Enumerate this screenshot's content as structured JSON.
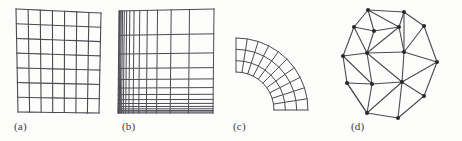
{
  "figure": {
    "width": 462,
    "height": 141,
    "background_color": "#fdfdfc",
    "line_color": "#4a4a52",
    "node_color": "#27272c",
    "caption_color": "#3a3a3e"
  },
  "captions": {
    "a": "(a)",
    "b": "(b)",
    "c": "(c)",
    "d": "(d)"
  },
  "chart_data": [
    {
      "type": "mesh-structured-uniform",
      "panel": "a",
      "title": "(a)",
      "description": "Uniform structured quadrilateral grid, slightly skewed quadrilateral outline",
      "n_columns": 7,
      "n_rows": 7,
      "n_vertical_lines": 8,
      "n_horizontal_lines": 8,
      "spacing": "uniform",
      "corners": {
        "top_left": [
          16,
          9
        ],
        "top_right": [
          101,
          13
        ],
        "bottom_right": [
          99,
          113
        ],
        "bottom_left": [
          18,
          112
        ]
      },
      "line_color": "#4a4a52",
      "line_width": 1.1
    },
    {
      "type": "mesh-structured-graded",
      "panel": "b",
      "title": "(b)",
      "description": "Graded (geometrically stretched) structured quadrilateral grid; lines clustered toward the left edge and the bottom edge",
      "n_columns": 14,
      "n_rows": 13,
      "n_vertical_lines": 15,
      "n_horizontal_lines": 14,
      "spacing": "geometric",
      "clustering_x": "left",
      "clustering_y": "bottom",
      "growth_ratio_x": 1.34,
      "growth_ratio_y": 1.3,
      "corners": {
        "top_left": [
          119,
          11
        ],
        "top_right": [
          214,
          9
        ],
        "bottom_right": [
          213,
          113
        ],
        "bottom_left": [
          118,
          113
        ]
      },
      "line_color": "#4a4a52",
      "line_width": 1.0
    },
    {
      "type": "mesh-structured-curvilinear",
      "panel": "c",
      "title": "(c)",
      "description": "Curvilinear structured quadrilateral grid mapped onto a quarter annulus (90 degree bend)",
      "n_radial_layers": 3,
      "n_angular_divisions": 10,
      "n_radial_lines": 4,
      "n_angular_lines": 11,
      "center": [
        236,
        110
      ],
      "inner_radius": 38,
      "outer_radius": 72,
      "start_angle_deg": -90,
      "end_angle_deg": 0,
      "line_color": "#4a4a52",
      "line_width": 1.0
    },
    {
      "type": "mesh-unstructured-triangular",
      "panel": "d",
      "title": "(d)",
      "description": "Unstructured triangular mesh over a convex polygonal domain with filled circular nodes",
      "n_nodes": 16,
      "n_boundary_nodes": 9,
      "n_interior_nodes": 7,
      "n_triangles": 21,
      "node_marker": "filled-circle",
      "node_radius": 2.0,
      "nodes": [
        [
          28,
          10
        ],
        [
          64,
          12
        ],
        [
          84,
          26
        ],
        [
          97,
          62
        ],
        [
          84,
          96
        ],
        [
          58,
          118
        ],
        [
          27,
          113
        ],
        [
          7,
          83
        ],
        [
          3,
          56
        ],
        [
          14,
          27
        ],
        [
          34,
          31
        ],
        [
          27,
          53
        ],
        [
          59,
          27
        ],
        [
          64,
          52
        ],
        [
          62,
          82
        ],
        [
          32,
          84
        ]
      ],
      "edges": [
        [
          0,
          1
        ],
        [
          1,
          2
        ],
        [
          2,
          3
        ],
        [
          3,
          4
        ],
        [
          4,
          5
        ],
        [
          5,
          6
        ],
        [
          6,
          7
        ],
        [
          7,
          8
        ],
        [
          8,
          9
        ],
        [
          9,
          0
        ],
        [
          0,
          10
        ],
        [
          9,
          10
        ],
        [
          10,
          12
        ],
        [
          0,
          12
        ],
        [
          1,
          12
        ],
        [
          10,
          11
        ],
        [
          9,
          11
        ],
        [
          8,
          11
        ],
        [
          11,
          12
        ],
        [
          11,
          13
        ],
        [
          12,
          13
        ],
        [
          1,
          13
        ],
        [
          2,
          13
        ],
        [
          13,
          3
        ],
        [
          11,
          15
        ],
        [
          8,
          15
        ],
        [
          7,
          15
        ],
        [
          15,
          14
        ],
        [
          11,
          14
        ],
        [
          13,
          14
        ],
        [
          14,
          3
        ],
        [
          14,
          4
        ],
        [
          15,
          6
        ],
        [
          6,
          14
        ],
        [
          5,
          14
        ],
        [
          7,
          6
        ]
      ],
      "line_color": "#4a4a52",
      "line_width": 1.1
    }
  ]
}
